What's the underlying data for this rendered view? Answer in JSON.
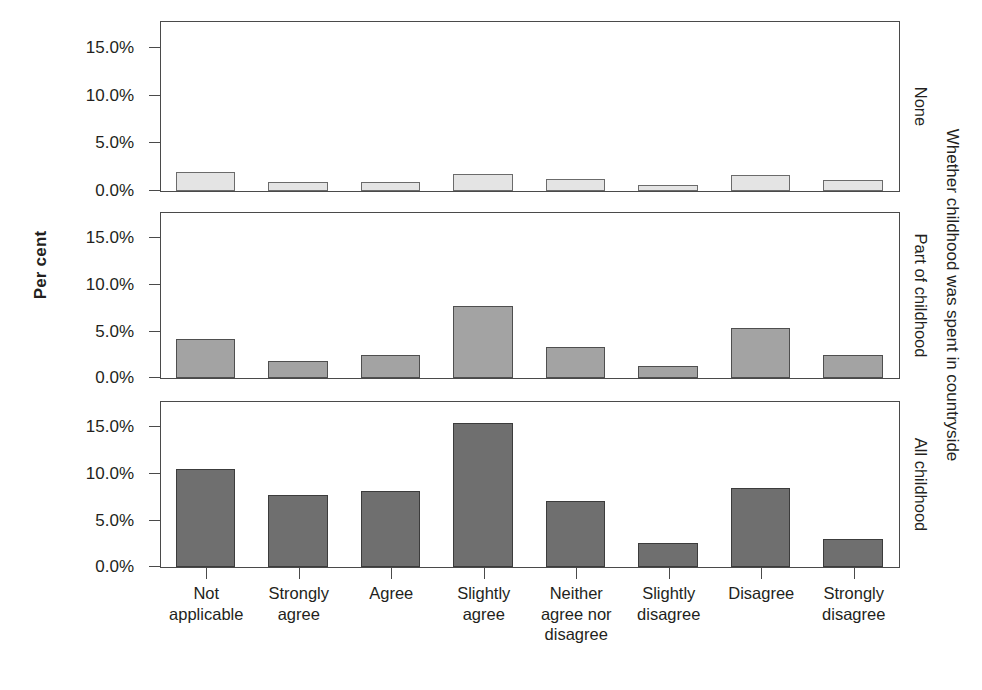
{
  "chart_data": {
    "type": "bar",
    "title": "",
    "subtitle": "",
    "xlabel": "",
    "ylabel": "Per cent",
    "ylim": [
      0,
      17.5
    ],
    "yticks": [
      0,
      5,
      10,
      15
    ],
    "ytick_labels": [
      "0.0%",
      "5.0%",
      "10.0%",
      "15.0%"
    ],
    "grid": false,
    "legend_position": "none",
    "facet_variable": "Whether childhood was spent in countryside",
    "categories": [
      "Not applicable",
      "Strongly agree",
      "Agree",
      "Slightly agree",
      "Neither agree nor disagree",
      "Slightly disagree",
      "Disagree",
      "Strongly disagree"
    ],
    "series": [
      {
        "name": "None",
        "values": [
          2.0,
          0.9,
          0.9,
          1.8,
          1.3,
          0.6,
          1.7,
          1.2
        ],
        "color": "#e4e4e4"
      },
      {
        "name": "Part of childhood",
        "values": [
          4.2,
          1.8,
          2.5,
          7.7,
          3.3,
          1.3,
          5.3,
          2.5
        ],
        "color": "#a3a3a3"
      },
      {
        "name": "All childhood",
        "values": [
          10.5,
          7.7,
          8.1,
          15.4,
          7.1,
          2.6,
          8.4,
          3.0
        ],
        "color": "#6f6f6f"
      }
    ]
  },
  "axes": {
    "y_title": "Per cent",
    "y_tick_labels": [
      "15.0%",
      "10.0%",
      "5.0%",
      "0.0%"
    ],
    "x_tick_labels": [
      "Not\napplicable",
      "Strongly\nagree",
      "Agree",
      "Slightly\nagree",
      "Neither\nagree nor\ndisagree",
      "Slightly\ndisagree",
      "Disagree",
      "Strongly\ndisagree"
    ]
  },
  "strips": {
    "outer_label": "Whether childhood was spent in countryside",
    "panel_labels": [
      "None",
      "Part of childhood",
      "All childhood"
    ]
  }
}
